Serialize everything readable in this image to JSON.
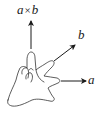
{
  "diagram": {
    "vectors": [
      {
        "id": "a",
        "label": "a",
        "direction": "right",
        "finger": "middle"
      },
      {
        "id": "b",
        "label": "b",
        "direction": "up-right",
        "finger": "index"
      },
      {
        "id": "axb",
        "label_left": "a",
        "label_op": "×",
        "label_right": "b",
        "direction": "up",
        "finger": "thumb"
      }
    ],
    "colors": {
      "stroke": "#1a1a1a",
      "hand_outline": "#333333",
      "background": "#ffffff"
    }
  }
}
